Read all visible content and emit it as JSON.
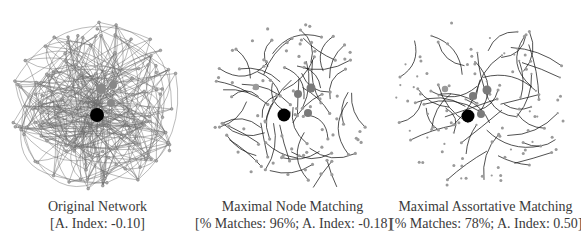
{
  "panels": [
    {
      "id": "original",
      "title": "Original Network",
      "subtitle": "[A. Index: -0.10]",
      "matches_pct": null,
      "assortativity_index": -0.1
    },
    {
      "id": "node-matching",
      "title": "Maximal Node Matching",
      "subtitle": "[% Matches: 96%; A. Index: -0.18]",
      "matches_pct": 96,
      "assortativity_index": -0.18
    },
    {
      "id": "assortative-matching",
      "title": "Maximal Assortative Matching",
      "subtitle": "[% Matches: 78%; A. Index: 0.50]",
      "matches_pct": 78,
      "assortativity_index": 0.5
    }
  ],
  "colors": {
    "hub_node": "#000000",
    "large_node": "#7a7a7a",
    "small_node": "#9a9a9a",
    "edge_dense": "#6b6b6b",
    "edge_matched": "#1a1a1a"
  }
}
